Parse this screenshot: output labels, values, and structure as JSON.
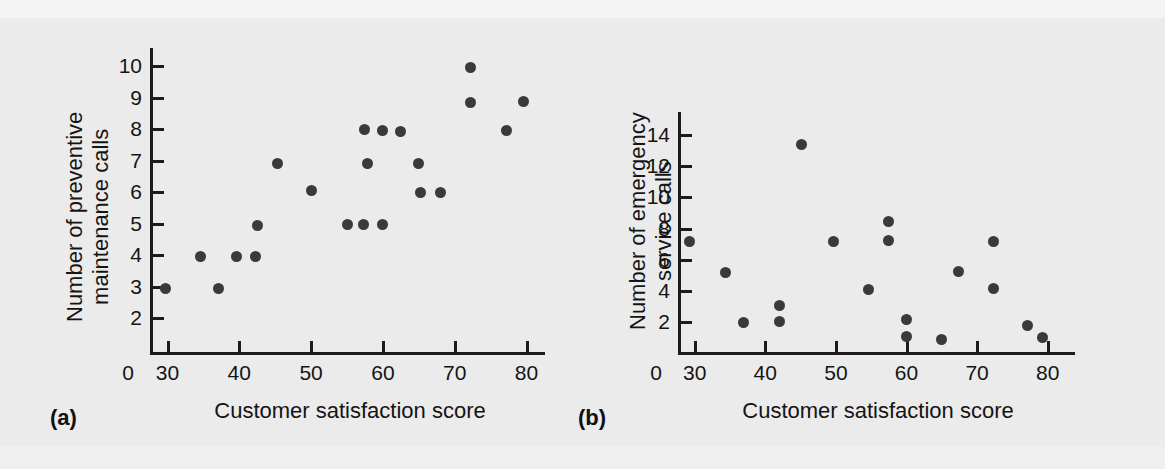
{
  "figure": {
    "background_color": "#ebebeb",
    "point_color": "#3a3a3a",
    "axis_color": "#1b1b1b"
  },
  "panel_a": {
    "label": "(a)",
    "xlabel": "Customer satisfaction score",
    "ylabel_line1": "Number of preventive",
    "ylabel_line2": "maintenance calls",
    "x_ticks": [
      "0",
      "30",
      "40",
      "50",
      "60",
      "70",
      "80"
    ],
    "y_ticks": [
      "2",
      "3",
      "4",
      "5",
      "6",
      "7",
      "8",
      "9",
      "10"
    ]
  },
  "panel_b": {
    "label": "(b)",
    "xlabel": "Customer satisfaction score",
    "ylabel_line1": "Number of emergency",
    "ylabel_line2": "service calls",
    "x_ticks": [
      "0",
      "30",
      "40",
      "50",
      "60",
      "70",
      "80"
    ],
    "y_ticks": [
      "2",
      "4",
      "6",
      "8",
      "10",
      "12",
      "14"
    ]
  },
  "chart_data": [
    {
      "type": "scatter",
      "panel": "(a)",
      "title": "",
      "xlabel": "Customer satisfaction score",
      "ylabel": "Number of preventive maintenance calls",
      "xlim": [
        26,
        83
      ],
      "ylim": [
        1.3,
        10.6
      ],
      "xticks": [
        30,
        40,
        50,
        60,
        70,
        80
      ],
      "yticks": [
        2,
        3,
        4,
        5,
        6,
        7,
        8,
        9,
        10
      ],
      "grid": false,
      "legend": null,
      "x": [
        29.7,
        34.6,
        37.1,
        39.6,
        42.2,
        42.6,
        45.3,
        50.0,
        55.0,
        57.3,
        57.5,
        57.8,
        60.0,
        60.0,
        62.5,
        65.0,
        65.2,
        68.0,
        72.2,
        72.2,
        77.2,
        79.6
      ],
      "y": [
        2.95,
        3.95,
        2.93,
        3.95,
        3.95,
        4.93,
        6.9,
        6.05,
        4.97,
        4.97,
        7.97,
        6.9,
        4.97,
        7.95,
        7.93,
        6.9,
        6.0,
        6.0,
        9.95,
        8.85,
        7.95,
        8.88
      ]
    },
    {
      "type": "scatter",
      "panel": "(b)",
      "title": "",
      "xlabel": "Customer satisfaction score",
      "ylabel": "Number of emergency service calls",
      "xlim": [
        26,
        83
      ],
      "ylim": [
        0.2,
        15.2
      ],
      "xticks": [
        30,
        40,
        50,
        60,
        70,
        80
      ],
      "yticks": [
        2,
        4,
        6,
        8,
        10,
        12,
        14
      ],
      "grid": false,
      "legend": null,
      "x": [
        29.3,
        34.3,
        36.9,
        42.0,
        42.0,
        45.1,
        49.7,
        54.6,
        57.4,
        57.4,
        60.0,
        60.0,
        65.0,
        67.3,
        72.3,
        72.3,
        77.2,
        79.3
      ],
      "y": [
        7.2,
        5.15,
        2.0,
        3.05,
        2.05,
        13.4,
        7.2,
        4.1,
        8.45,
        7.25,
        2.15,
        1.05,
        0.9,
        5.25,
        7.2,
        4.15,
        1.8,
        1.0
      ]
    }
  ]
}
